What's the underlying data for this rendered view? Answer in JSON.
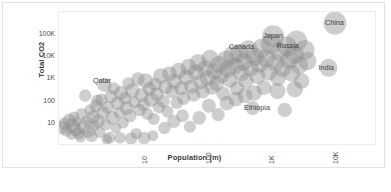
{
  "chart_data": {
    "type": "scatter",
    "title": "",
    "xlabel": "Population (m)",
    "ylabel": "Total CO2",
    "xscale": "log",
    "yscale": "log",
    "grid": false,
    "legend": "none",
    "xticks": [
      "10",
      "100",
      "1K",
      "10K"
    ],
    "xtick_values": [
      10,
      100,
      1000,
      10000
    ],
    "yticks": [
      "10",
      "100",
      "1K",
      "10K",
      "100K"
    ],
    "ytick_values": [
      10,
      100,
      1000,
      10000,
      100000
    ],
    "xlim": [
      0.55,
      55000
    ],
    "ylim": [
      1.1,
      1100000
    ],
    "marker": {
      "shape": "circle",
      "fill": "#8a8a8a",
      "opacity": 0.42,
      "edge": "none",
      "size_encodes": "value"
    },
    "annotations": [
      {
        "label": "Qatar",
        "x": 2.7,
        "y": 900
      },
      {
        "label": "Canada",
        "x": 370,
        "y": 30000
      },
      {
        "label": "Japan",
        "x": 1280,
        "y": 90000
      },
      {
        "label": "Russia",
        "x": 2100,
        "y": 32000
      },
      {
        "label": "China",
        "x": 12000,
        "y": 350000
      },
      {
        "label": "India",
        "x": 9500,
        "y": 3500
      },
      {
        "label": "Ethiopia",
        "x": 640,
        "y": 55
      }
    ],
    "points": [
      {
        "x": 0.62,
        "y": 7.5,
        "r": 7.0
      },
      {
        "x": 0.68,
        "y": 11,
        "r": 6.4
      },
      {
        "x": 0.72,
        "y": 5.2,
        "r": 5.8
      },
      {
        "x": 0.8,
        "y": 16,
        "r": 6.6
      },
      {
        "x": 0.86,
        "y": 3.6,
        "r": 5.2
      },
      {
        "x": 0.9,
        "y": 9.0,
        "r": 7.2
      },
      {
        "x": 0.95,
        "y": 22,
        "r": 5.4
      },
      {
        "x": 1.0,
        "y": 6.0,
        "r": 6.8
      },
      {
        "x": 1.05,
        "y": 13,
        "r": 5.0
      },
      {
        "x": 1.12,
        "y": 4.0,
        "r": 6.2
      },
      {
        "x": 1.2,
        "y": 2.8,
        "r": 5.6
      },
      {
        "x": 1.25,
        "y": 30,
        "r": 6.0
      },
      {
        "x": 1.35,
        "y": 8.0,
        "r": 7.4
      },
      {
        "x": 1.42,
        "y": 200,
        "r": 6.2
      },
      {
        "x": 1.5,
        "y": 15,
        "r": 5.4
      },
      {
        "x": 1.6,
        "y": 5.0,
        "r": 6.6
      },
      {
        "x": 1.7,
        "y": 45,
        "r": 5.8
      },
      {
        "x": 1.8,
        "y": 3.0,
        "r": 6.0
      },
      {
        "x": 1.9,
        "y": 22,
        "r": 6.8
      },
      {
        "x": 2.0,
        "y": 9.0,
        "r": 5.2
      },
      {
        "x": 2.1,
        "y": 70,
        "r": 6.4
      },
      {
        "x": 2.25,
        "y": 14,
        "r": 7.0
      },
      {
        "x": 2.4,
        "y": 4.5,
        "r": 5.6
      },
      {
        "x": 2.55,
        "y": 130,
        "r": 6.2
      },
      {
        "x": 2.7,
        "y": 35,
        "r": 6.8
      },
      {
        "x": 2.85,
        "y": 600,
        "r": 7.2
      },
      {
        "x": 3.0,
        "y": 10,
        "r": 5.8
      },
      {
        "x": 3.2,
        "y": 60,
        "r": 6.4
      },
      {
        "x": 3.4,
        "y": 2.6,
        "r": 6.0
      },
      {
        "x": 3.6,
        "y": 180,
        "r": 6.6
      },
      {
        "x": 3.8,
        "y": 20,
        "r": 7.0
      },
      {
        "x": 4.0,
        "y": 420,
        "r": 6.2
      },
      {
        "x": 4.3,
        "y": 7.0,
        "r": 5.4
      },
      {
        "x": 4.6,
        "y": 90,
        "r": 6.8
      },
      {
        "x": 4.9,
        "y": 33,
        "r": 6.0
      },
      {
        "x": 5.2,
        "y": 260,
        "r": 7.2
      },
      {
        "x": 5.6,
        "y": 12,
        "r": 5.8
      },
      {
        "x": 6.0,
        "y": 150,
        "r": 6.4
      },
      {
        "x": 6.4,
        "y": 55,
        "r": 7.0
      },
      {
        "x": 6.8,
        "y": 700,
        "r": 6.2
      },
      {
        "x": 7.2,
        "y": 25,
        "r": 6.6
      },
      {
        "x": 7.8,
        "y": 330,
        "r": 7.4
      },
      {
        "x": 8.4,
        "y": 100,
        "r": 6.0
      },
      {
        "x": 9.0,
        "y": 4.0,
        "r": 5.6
      },
      {
        "x": 9.6,
        "y": 1100,
        "r": 6.8
      },
      {
        "x": 10.2,
        "y": 45,
        "r": 6.2
      },
      {
        "x": 11.0,
        "y": 210,
        "r": 7.0
      },
      {
        "x": 11.8,
        "y": 80,
        "r": 6.4
      },
      {
        "x": 12.6,
        "y": 900,
        "r": 7.6
      },
      {
        "x": 13.5,
        "y": 30,
        "r": 6.0
      },
      {
        "x": 14.5,
        "y": 400,
        "r": 6.8
      },
      {
        "x": 15.5,
        "y": 130,
        "r": 7.2
      },
      {
        "x": 16.5,
        "y": 3.2,
        "r": 5.4
      },
      {
        "x": 18.0,
        "y": 650,
        "r": 6.6
      },
      {
        "x": 19.0,
        "y": 230,
        "r": 7.0
      },
      {
        "x": 20.5,
        "y": 60,
        "r": 6.2
      },
      {
        "x": 22.0,
        "y": 1500,
        "r": 7.8
      },
      {
        "x": 24.0,
        "y": 110,
        "r": 6.6
      },
      {
        "x": 26.0,
        "y": 480,
        "r": 7.2
      },
      {
        "x": 28.0,
        "y": 38,
        "r": 6.0
      },
      {
        "x": 30.0,
        "y": 1900,
        "r": 7.4
      },
      {
        "x": 33.0,
        "y": 300,
        "r": 6.8
      },
      {
        "x": 36.0,
        "y": 850,
        "r": 7.6
      },
      {
        "x": 39.0,
        "y": 95,
        "r": 6.2
      },
      {
        "x": 42.0,
        "y": 2600,
        "r": 8.0
      },
      {
        "x": 46.0,
        "y": 420,
        "r": 7.0
      },
      {
        "x": 50.0,
        "y": 150,
        "r": 6.6
      },
      {
        "x": 55.0,
        "y": 1300,
        "r": 7.8
      },
      {
        "x": 60.0,
        "y": 3800,
        "r": 8.2
      },
      {
        "x": 66.0,
        "y": 500,
        "r": 7.2
      },
      {
        "x": 72.0,
        "y": 210,
        "r": 6.8
      },
      {
        "x": 78.0,
        "y": 2200,
        "r": 8.0
      },
      {
        "x": 85.0,
        "y": 6000,
        "r": 8.6
      },
      {
        "x": 92.0,
        "y": 800,
        "r": 7.4
      },
      {
        "x": 100,
        "y": 300,
        "r": 7.0
      },
      {
        "x": 110,
        "y": 3200,
        "r": 8.4
      },
      {
        "x": 120,
        "y": 1200,
        "r": 7.8
      },
      {
        "x": 130,
        "y": 9000,
        "r": 8.8
      },
      {
        "x": 140,
        "y": 450,
        "r": 7.2
      },
      {
        "x": 152,
        "y": 2400,
        "r": 8.2
      },
      {
        "x": 165,
        "y": 700,
        "r": 7.6
      },
      {
        "x": 180,
        "y": 5000,
        "r": 8.6
      },
      {
        "x": 195,
        "y": 1600,
        "r": 8.0
      },
      {
        "x": 210,
        "y": 240,
        "r": 7.0
      },
      {
        "x": 230,
        "y": 8000,
        "r": 9.0
      },
      {
        "x": 250,
        "y": 3000,
        "r": 8.4
      },
      {
        "x": 270,
        "y": 1000,
        "r": 7.8
      },
      {
        "x": 295,
        "y": 13000,
        "r": 9.2
      },
      {
        "x": 320,
        "y": 4200,
        "r": 8.6
      },
      {
        "x": 345,
        "y": 420,
        "r": 7.2
      },
      {
        "x": 375,
        "y": 16000,
        "r": 9.4
      },
      {
        "x": 405,
        "y": 2000,
        "r": 8.2
      },
      {
        "x": 440,
        "y": 6500,
        "r": 8.8
      },
      {
        "x": 480,
        "y": 900,
        "r": 7.6
      },
      {
        "x": 520,
        "y": 22000,
        "r": 9.6
      },
      {
        "x": 560,
        "y": 3400,
        "r": 8.4
      },
      {
        "x": 610,
        "y": 55,
        "r": 7.0
      },
      {
        "x": 660,
        "y": 11000,
        "r": 9.0
      },
      {
        "x": 720,
        "y": 1500,
        "r": 8.0
      },
      {
        "x": 780,
        "y": 5200,
        "r": 8.8
      },
      {
        "x": 850,
        "y": 26000,
        "r": 9.8
      },
      {
        "x": 920,
        "y": 450,
        "r": 7.4
      },
      {
        "x": 1000,
        "y": 9000,
        "r": 9.2
      },
      {
        "x": 1090,
        "y": 2200,
        "r": 8.4
      },
      {
        "x": 1180,
        "y": 40000,
        "r": 10.2
      },
      {
        "x": 1280,
        "y": 90000,
        "r": 11.0
      },
      {
        "x": 1400,
        "y": 6000,
        "r": 9.0
      },
      {
        "x": 1520,
        "y": 1200,
        "r": 8.0
      },
      {
        "x": 1650,
        "y": 18000,
        "r": 9.6
      },
      {
        "x": 1800,
        "y": 3200,
        "r": 8.6
      },
      {
        "x": 1950,
        "y": 45,
        "r": 7.2
      },
      {
        "x": 2100,
        "y": 32000,
        "r": 10.0
      },
      {
        "x": 2300,
        "y": 8000,
        "r": 9.2
      },
      {
        "x": 2500,
        "y": 2000,
        "r": 8.4
      },
      {
        "x": 2750,
        "y": 14000,
        "r": 9.6
      },
      {
        "x": 3000,
        "y": 55000,
        "r": 10.6
      },
      {
        "x": 3300,
        "y": 4500,
        "r": 8.8
      },
      {
        "x": 3600,
        "y": 900,
        "r": 7.8
      },
      {
        "x": 4000,
        "y": 22000,
        "r": 10.0
      },
      {
        "x": 4400,
        "y": 7000,
        "r": 9.2
      },
      {
        "x": 9500,
        "y": 3500,
        "r": 9.0
      },
      {
        "x": 12000,
        "y": 350000,
        "r": 11.5
      },
      {
        "x": 2.2,
        "y": 120,
        "r": 6.0
      },
      {
        "x": 3.1,
        "y": 2.2,
        "r": 5.4
      },
      {
        "x": 5.0,
        "y": 2.6,
        "r": 5.8
      },
      {
        "x": 7.5,
        "y": 2.4,
        "r": 6.2
      },
      {
        "x": 12.0,
        "y": 2.5,
        "r": 6.4
      },
      {
        "x": 17.0,
        "y": 18,
        "r": 6.0
      },
      {
        "x": 25.0,
        "y": 7.0,
        "r": 6.2
      },
      {
        "x": 35.0,
        "y": 14,
        "r": 6.6
      },
      {
        "x": 48.0,
        "y": 25,
        "r": 6.4
      },
      {
        "x": 63.0,
        "y": 8.0,
        "r": 6.0
      },
      {
        "x": 88.0,
        "y": 20,
        "r": 6.8
      },
      {
        "x": 125,
        "y": 70,
        "r": 7.0
      },
      {
        "x": 175,
        "y": 28,
        "r": 6.6
      },
      {
        "x": 240,
        "y": 90,
        "r": 7.2
      },
      {
        "x": 330,
        "y": 140,
        "r": 7.4
      },
      {
        "x": 460,
        "y": 200,
        "r": 7.6
      },
      {
        "x": 640,
        "y": 260,
        "r": 7.8
      },
      {
        "x": 1500,
        "y": 320,
        "r": 8.0
      },
      {
        "x": 2800,
        "y": 380,
        "r": 8.2
      }
    ]
  },
  "axes": {
    "y_title": "Total CO2",
    "x_title": "Population (m)"
  }
}
